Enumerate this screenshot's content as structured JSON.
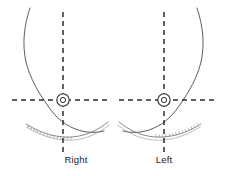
{
  "figure": {
    "title": "",
    "type": "anatomical-schematic",
    "background_color": "#ffffff",
    "line_color": "#4a4a4a",
    "axis_color": "#2b2b2b",
    "fold_color": "#8a8a8a"
  },
  "panels": [
    {
      "id": "right",
      "label": "Right",
      "label_x": 76,
      "label_y": 163,
      "vertical_axis_x": 63,
      "horizontal_axis_y": 100,
      "nipple": {
        "cx": 63,
        "cy": 100,
        "outer_r": 6.2,
        "inner_r": 2.6
      },
      "contour_path": "M 30 8 C 24 26, 22 44, 26 62 C 30 78, 38 92, 48 106 C 56 118, 66 126, 78 130 C 88 133, 96 133, 104 131",
      "fold_solid_path": "M 26 124 C 40 133, 56 138, 72 137 C 86 136, 98 130, 108 122",
      "fold_dotted_path": "M 27 127 C 41 136, 57 141, 73 140 C 87 139, 99 133, 109 125",
      "hatch_start_x": 27,
      "hatch_end_x": 74,
      "v_axis_top": 12,
      "v_axis_bottom": 152,
      "h_axis_left": 12,
      "h_axis_right": 108
    },
    {
      "id": "left",
      "label": "Left",
      "label_x": 164,
      "label_y": 163,
      "vertical_axis_x": 164,
      "horizontal_axis_y": 100,
      "nipple": {
        "cx": 164,
        "cy": 100,
        "outer_r": 6.2,
        "inner_r": 2.6
      },
      "contour_path": "M 197 8 C 203 26, 205 44, 201 62 C 197 78, 189 92, 179 106 C 171 118, 161 126, 149 130 C 139 133, 131 133, 123 131",
      "fold_solid_path": "M 201 124 C 187 133, 171 138, 155 137 C 141 136, 129 130, 119 122",
      "fold_dotted_path": "M 200 127 C 186 136, 170 141, 154 140 C 140 139, 128 133, 118 125",
      "hatch_start_x": 153,
      "hatch_end_x": 200,
      "v_axis_top": 12,
      "v_axis_bottom": 152,
      "h_axis_left": 119,
      "h_axis_right": 218
    }
  ]
}
